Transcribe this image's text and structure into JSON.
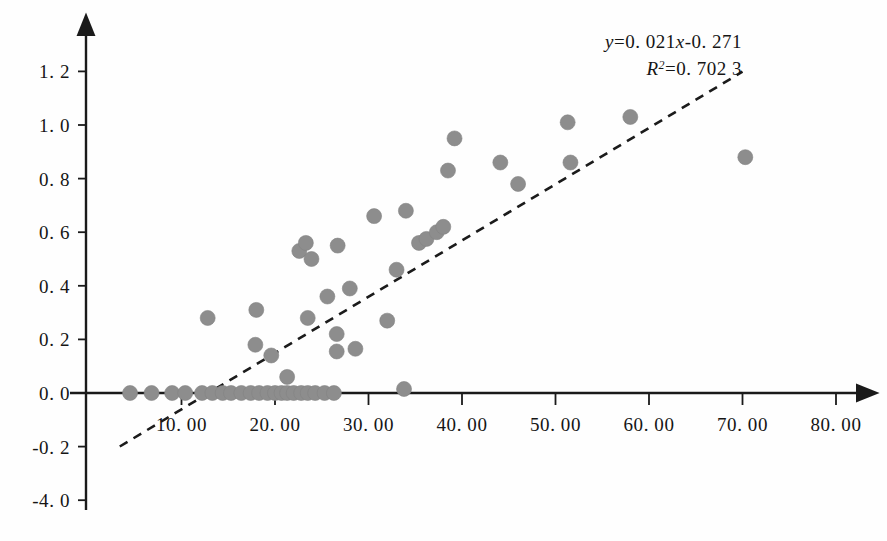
{
  "chart_data": {
    "type": "scatter",
    "title": "",
    "subtitle": "",
    "xlabel": "",
    "ylabel": "",
    "xlim": [
      0,
      80
    ],
    "ylim": [
      -0.4,
      1.3
    ],
    "grid": false,
    "legend": null,
    "x_ticks": [
      10,
      20,
      30,
      40,
      50,
      60,
      70,
      80
    ],
    "x_tick_labels": [
      "10. 00",
      "20. 00",
      "30. 00",
      "40. 00",
      "50. 00",
      "60. 00",
      "70. 00",
      "80. 00"
    ],
    "y_ticks": [
      1.2,
      1.0,
      0.8,
      0.6,
      0.4,
      0.2,
      0.0,
      -0.2,
      -0.4
    ],
    "y_tick_labels": [
      "1. 2",
      "1. 0",
      "0. 8",
      "0. 6",
      "0. 4",
      "0. 2",
      "0. 0",
      "-0. 2",
      "-4. 0"
    ],
    "marker_color": "#8d8d8d",
    "marker_radius_px": 7.5,
    "points": [
      [
        4.5,
        0.0
      ],
      [
        6.8,
        0.0
      ],
      [
        9.0,
        0.0
      ],
      [
        10.4,
        0.0
      ],
      [
        12.2,
        0.0
      ],
      [
        13.3,
        0.0
      ],
      [
        14.4,
        0.0
      ],
      [
        15.3,
        0.0
      ],
      [
        16.4,
        0.0
      ],
      [
        17.4,
        0.0
      ],
      [
        18.3,
        0.0
      ],
      [
        19.2,
        0.0
      ],
      [
        20.0,
        0.0
      ],
      [
        20.7,
        0.0
      ],
      [
        21.3,
        0.0
      ],
      [
        21.3,
        0.06
      ],
      [
        22.0,
        0.0
      ],
      [
        22.8,
        0.0
      ],
      [
        23.5,
        0.0
      ],
      [
        24.3,
        0.0
      ],
      [
        25.3,
        0.0
      ],
      [
        26.3,
        0.0
      ],
      [
        33.8,
        0.015
      ],
      [
        12.8,
        0.28
      ],
      [
        18.0,
        0.31
      ],
      [
        17.9,
        0.18
      ],
      [
        19.6,
        0.14
      ],
      [
        22.6,
        0.53
      ],
      [
        23.3,
        0.56
      ],
      [
        23.9,
        0.5
      ],
      [
        23.5,
        0.28
      ],
      [
        25.6,
        0.36
      ],
      [
        26.7,
        0.55
      ],
      [
        26.6,
        0.22
      ],
      [
        26.6,
        0.155
      ],
      [
        28.0,
        0.39
      ],
      [
        28.6,
        0.165
      ],
      [
        30.6,
        0.66
      ],
      [
        32.0,
        0.27
      ],
      [
        33.0,
        0.46
      ],
      [
        34.0,
        0.68
      ],
      [
        35.4,
        0.56
      ],
      [
        36.2,
        0.575
      ],
      [
        37.3,
        0.6
      ],
      [
        38.0,
        0.62
      ],
      [
        38.5,
        0.83
      ],
      [
        39.2,
        0.95
      ],
      [
        44.1,
        0.86
      ],
      [
        46.0,
        0.78
      ],
      [
        51.3,
        1.01
      ],
      [
        51.6,
        0.86
      ],
      [
        58.0,
        1.03
      ],
      [
        70.3,
        0.88
      ]
    ],
    "trendline": {
      "equation_y": "y",
      "equation_rest": "=0. 021",
      "equation_x": "x",
      "equation_tail": "-0. 271",
      "r2_label": "R",
      "r2_sup": "2",
      "r2_value": "=0. 702  3",
      "slope": 0.021,
      "intercept": -0.271,
      "r_squared": 0.7023,
      "x_start": 3.4,
      "x_end": 70.0,
      "style": "dashed"
    }
  }
}
